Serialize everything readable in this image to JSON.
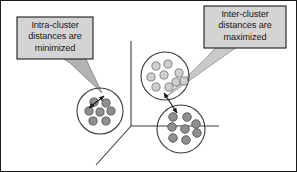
{
  "figure": {
    "background_color": "#ffffff",
    "frame_color": "#1a1a1a",
    "width": 297,
    "height": 172
  },
  "callouts": [
    {
      "id": "intra",
      "name": "intra-cluster-callout",
      "line1": "Intra-cluster",
      "line2": "distances are",
      "line3": "minimized",
      "text": "Intra-cluster\ndistances are\nminimized",
      "fill_color": "#d4d4d4",
      "border_color": "#1a1a1a",
      "tail_color": "#b3b3b3",
      "box": {
        "x": 16,
        "y": 16,
        "width": 76,
        "height": 42
      },
      "tail_target": {
        "x": 101,
        "y": 92
      }
    },
    {
      "id": "inter",
      "name": "inter-cluster-callout",
      "line1": "Inter-cluster",
      "line2": "distances are",
      "line3": "maximized",
      "text": "Inter-cluster\ndistances are\nmaximized",
      "fill_color": "#d4d4d4",
      "border_color": "#1a1a1a",
      "tail_color": "#b3b3b3",
      "box": {
        "x": 203,
        "y": 5,
        "width": 82,
        "height": 42
      },
      "tail_target": {
        "x": 165,
        "y": 96
      }
    }
  ],
  "axes": {
    "name": "three-axis-coordinate-system",
    "color": "#3b3b3b",
    "origin": {
      "x": 130,
      "y": 125
    },
    "vertical_end": {
      "x": 130,
      "y": 40
    },
    "horizontal_end": {
      "x": 218,
      "y": 125
    },
    "diagonal_end": {
      "x": 95,
      "y": 164
    }
  },
  "clusters": [
    {
      "id": "left",
      "name": "cluster-left",
      "center": {
        "x": 99,
        "y": 110
      },
      "radius": 23,
      "outline_color": "#3b3b3b",
      "point_fill": "#8f8f8f",
      "point_stroke": "#4a4a4a",
      "point_radius": 4.1,
      "point_count": 7,
      "points": [
        {
          "x": 93,
          "y": 101
        },
        {
          "x": 105,
          "y": 102
        },
        {
          "x": 88,
          "y": 110
        },
        {
          "x": 99,
          "y": 111
        },
        {
          "x": 110,
          "y": 110
        },
        {
          "x": 92,
          "y": 120
        },
        {
          "x": 105,
          "y": 120
        }
      ]
    },
    {
      "id": "top-right",
      "name": "cluster-top-right",
      "center": {
        "x": 164,
        "y": 75
      },
      "radius": 24,
      "outline_color": "#3b3b3b",
      "point_fill": "#cfcfcf",
      "point_stroke": "#6b6b6b",
      "point_radius": 4.1,
      "point_count": 9,
      "points": [
        {
          "x": 155,
          "y": 65
        },
        {
          "x": 167,
          "y": 63
        },
        {
          "x": 177,
          "y": 69
        },
        {
          "x": 150,
          "y": 76
        },
        {
          "x": 163,
          "y": 74
        },
        {
          "x": 175,
          "y": 79
        },
        {
          "x": 155,
          "y": 86
        },
        {
          "x": 168,
          "y": 86
        },
        {
          "x": 178,
          "y": 72
        }
      ]
    },
    {
      "id": "bottom-right",
      "name": "cluster-bottom-right",
      "center": {
        "x": 180,
        "y": 128
      },
      "radius": 24,
      "outline_color": "#3b3b3b",
      "point_fill": "#8f8f8f",
      "point_stroke": "#4a4a4a",
      "point_radius": 4.3,
      "point_count": 8,
      "points": [
        {
          "x": 172,
          "y": 116
        },
        {
          "x": 186,
          "y": 116
        },
        {
          "x": 171,
          "y": 126
        },
        {
          "x": 184,
          "y": 128
        },
        {
          "x": 194,
          "y": 123
        },
        {
          "x": 172,
          "y": 137
        },
        {
          "x": 185,
          "y": 139
        },
        {
          "x": 196,
          "y": 132
        }
      ]
    }
  ],
  "distance_arrows": [
    {
      "id": "intra-arrow",
      "name": "intra-cluster-distance-arrow",
      "color": "#1a1a1a",
      "from": {
        "x": 88,
        "y": 107
      },
      "to": {
        "x": 103,
        "y": 95
      },
      "double_headed": true
    },
    {
      "id": "inter-arrow",
      "name": "inter-cluster-distance-arrow",
      "color": "#1a1a1a",
      "from": {
        "x": 163,
        "y": 92
      },
      "to": {
        "x": 176,
        "y": 112
      },
      "double_headed": true
    }
  ]
}
